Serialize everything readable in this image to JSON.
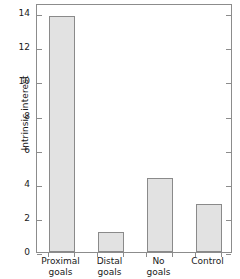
{
  "chart_data": {
    "type": "bar",
    "title": "",
    "xlabel": "",
    "ylabel": "Intrinsic interest",
    "categories": [
      "Proximal goals",
      "Distal goals",
      "No goals",
      "Control"
    ],
    "category_lines": [
      [
        "Proximal",
        "goals"
      ],
      [
        "Distal",
        "goals"
      ],
      [
        "No",
        "goals"
      ],
      [
        "Control"
      ]
    ],
    "values": [
      13.85,
      1.15,
      4.35,
      2.8
    ],
    "ylim": [
      0,
      14.6
    ],
    "yticks": [
      0,
      2,
      4,
      6,
      8,
      10,
      12,
      14
    ],
    "ytick_labels": [
      "0",
      "2",
      "4",
      "6",
      "8",
      "10",
      "12",
      "14"
    ],
    "grid": false,
    "legend": null,
    "bar_fill_color": "#e2e2e2",
    "bar_edge_color": "#8a8a8a",
    "axis_color": "#8c8c8c"
  }
}
